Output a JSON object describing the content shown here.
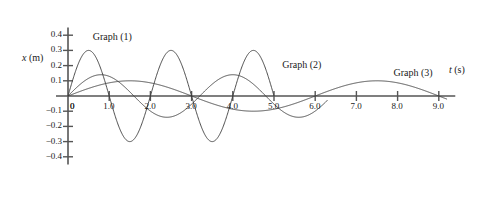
{
  "chart_data": {
    "type": "line",
    "title": "",
    "xlabel": "t (s)",
    "ylabel": "x (m)",
    "xlim": [
      0,
      9.4
    ],
    "ylim": [
      -0.45,
      0.45
    ],
    "grid": false,
    "legend_position": "inline-annotations",
    "x_ticks": [
      0,
      1.0,
      2.0,
      3.0,
      4.0,
      5.0,
      6.0,
      7.0,
      8.0,
      9.0
    ],
    "x_tick_labels": [
      "0",
      "1.0",
      "2.0",
      "3.0",
      "4.0",
      "5.0",
      "6.0",
      "7.0",
      "8.0",
      "9.0"
    ],
    "y_ticks": [
      0.4,
      0.3,
      0.2,
      0.1,
      0,
      -0.1,
      -0.2,
      -0.3,
      -0.4
    ],
    "y_tick_labels": [
      "0.4",
      "0.3",
      "0.2",
      "0.1",
      "0",
      "-0.1",
      "-0.2",
      "-0.3",
      "-0.4"
    ],
    "annotations": [
      {
        "text": "Graph (1)",
        "x": 0.6,
        "y": 0.38
      },
      {
        "text": "Graph (2)",
        "x": 5.2,
        "y": 0.2
      },
      {
        "text": "Graph (3)",
        "x": 7.9,
        "y": 0.145
      }
    ],
    "series": [
      {
        "name": "Graph (1)",
        "amplitude": 0.3,
        "period": 2.0,
        "phase": 0,
        "t_start": 0,
        "t_end": 5.0,
        "color": "#3a3a3a",
        "description": "Largest amplitude 0.30 m, shortest period 2.0 s, starts at origin rising"
      },
      {
        "name": "Graph (2)",
        "amplitude": 0.14,
        "period": 3.2,
        "phase": 0,
        "t_start": 0,
        "t_end": 6.3,
        "color": "#3a3a3a",
        "description": "Medium amplitude 0.14 m, period 3.2 s, starts at origin rising"
      },
      {
        "name": "Graph (3)",
        "amplitude": 0.1,
        "period": 6.0,
        "phase": 0,
        "t_start": 0,
        "t_end": 9.2,
        "color": "#3a3a3a",
        "description": "Smallest amplitude 0.10 m, longest period 6.0 s, starts at origin rising"
      }
    ]
  },
  "axes": {
    "y_axis_title": "x (m)",
    "x_axis_title": "t (s)"
  },
  "colors": {
    "axis": "#555555",
    "curve": "#3a3a3a",
    "text": "#1a1a1a",
    "background": "#ffffff"
  }
}
